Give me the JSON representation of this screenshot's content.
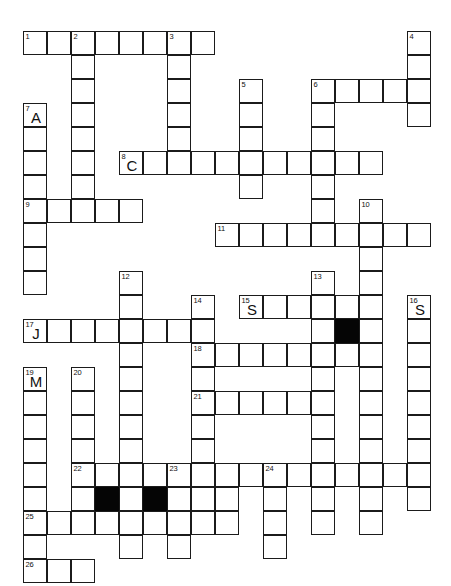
{
  "puzzle": {
    "title": "Crossword Grid",
    "grid": {
      "origin_x": 23,
      "origin_y": 31,
      "cell_size": 24,
      "columns": 17,
      "rows": 22
    },
    "colors": {
      "cell_fill": "#ffffff",
      "cell_border": "#1b1b1b",
      "block_fill": "#050505",
      "text": "#111111",
      "page_background": "#ffffff"
    },
    "legend": {
      "number_font_size_px": 7.5,
      "letter_font_size_px": 15
    },
    "cells": [
      {
        "c": 0,
        "r": 0,
        "num": "1",
        "letter": ""
      },
      {
        "c": 1,
        "r": 0,
        "num": "",
        "letter": ""
      },
      {
        "c": 2,
        "r": 0,
        "num": "2",
        "letter": ""
      },
      {
        "c": 3,
        "r": 0,
        "num": "",
        "letter": ""
      },
      {
        "c": 4,
        "r": 0,
        "num": "",
        "letter": ""
      },
      {
        "c": 5,
        "r": 0,
        "num": "",
        "letter": ""
      },
      {
        "c": 6,
        "r": 0,
        "num": "3",
        "letter": ""
      },
      {
        "c": 7,
        "r": 0,
        "num": "",
        "letter": ""
      },
      {
        "c": 16,
        "r": 0,
        "num": "4",
        "letter": ""
      },
      {
        "c": 2,
        "r": 1,
        "num": "",
        "letter": ""
      },
      {
        "c": 6,
        "r": 1,
        "num": "",
        "letter": ""
      },
      {
        "c": 16,
        "r": 1,
        "num": "",
        "letter": ""
      },
      {
        "c": 2,
        "r": 2,
        "num": "",
        "letter": ""
      },
      {
        "c": 6,
        "r": 2,
        "num": "",
        "letter": ""
      },
      {
        "c": 9,
        "r": 2,
        "num": "5",
        "letter": ""
      },
      {
        "c": 12,
        "r": 2,
        "num": "6",
        "letter": ""
      },
      {
        "c": 13,
        "r": 2,
        "num": "",
        "letter": ""
      },
      {
        "c": 14,
        "r": 2,
        "num": "",
        "letter": ""
      },
      {
        "c": 15,
        "r": 2,
        "num": "",
        "letter": ""
      },
      {
        "c": 16,
        "r": 2,
        "num": "",
        "letter": ""
      },
      {
        "c": 0,
        "r": 3,
        "num": "7",
        "letter": "A"
      },
      {
        "c": 2,
        "r": 3,
        "num": "",
        "letter": ""
      },
      {
        "c": 6,
        "r": 3,
        "num": "",
        "letter": ""
      },
      {
        "c": 9,
        "r": 3,
        "num": "",
        "letter": ""
      },
      {
        "c": 12,
        "r": 3,
        "num": "",
        "letter": ""
      },
      {
        "c": 16,
        "r": 3,
        "num": "",
        "letter": ""
      },
      {
        "c": 0,
        "r": 4,
        "num": "",
        "letter": ""
      },
      {
        "c": 2,
        "r": 4,
        "num": "",
        "letter": ""
      },
      {
        "c": 6,
        "r": 4,
        "num": "",
        "letter": ""
      },
      {
        "c": 9,
        "r": 4,
        "num": "",
        "letter": ""
      },
      {
        "c": 12,
        "r": 4,
        "num": "",
        "letter": ""
      },
      {
        "c": 0,
        "r": 5,
        "num": "",
        "letter": ""
      },
      {
        "c": 2,
        "r": 5,
        "num": "",
        "letter": ""
      },
      {
        "c": 4,
        "r": 5,
        "num": "8",
        "letter": "C"
      },
      {
        "c": 5,
        "r": 5,
        "num": "",
        "letter": ""
      },
      {
        "c": 6,
        "r": 5,
        "num": "",
        "letter": ""
      },
      {
        "c": 7,
        "r": 5,
        "num": "",
        "letter": ""
      },
      {
        "c": 8,
        "r": 5,
        "num": "",
        "letter": ""
      },
      {
        "c": 9,
        "r": 5,
        "num": "",
        "letter": ""
      },
      {
        "c": 10,
        "r": 5,
        "num": "",
        "letter": ""
      },
      {
        "c": 11,
        "r": 5,
        "num": "",
        "letter": ""
      },
      {
        "c": 12,
        "r": 5,
        "num": "",
        "letter": ""
      },
      {
        "c": 13,
        "r": 5,
        "num": "",
        "letter": ""
      },
      {
        "c": 14,
        "r": 5,
        "num": "",
        "letter": ""
      },
      {
        "c": 0,
        "r": 6,
        "num": "",
        "letter": ""
      },
      {
        "c": 2,
        "r": 6,
        "num": "",
        "letter": ""
      },
      {
        "c": 9,
        "r": 6,
        "num": "",
        "letter": ""
      },
      {
        "c": 12,
        "r": 6,
        "num": "",
        "letter": ""
      },
      {
        "c": 0,
        "r": 7,
        "num": "9",
        "letter": ""
      },
      {
        "c": 1,
        "r": 7,
        "num": "",
        "letter": ""
      },
      {
        "c": 2,
        "r": 7,
        "num": "",
        "letter": ""
      },
      {
        "c": 3,
        "r": 7,
        "num": "",
        "letter": ""
      },
      {
        "c": 4,
        "r": 7,
        "num": "",
        "letter": ""
      },
      {
        "c": 12,
        "r": 7,
        "num": "",
        "letter": ""
      },
      {
        "c": 14,
        "r": 7,
        "num": "10",
        "letter": ""
      },
      {
        "c": 0,
        "r": 8,
        "num": "",
        "letter": ""
      },
      {
        "c": 8,
        "r": 8,
        "num": "11",
        "letter": ""
      },
      {
        "c": 9,
        "r": 8,
        "num": "",
        "letter": ""
      },
      {
        "c": 10,
        "r": 8,
        "num": "",
        "letter": ""
      },
      {
        "c": 11,
        "r": 8,
        "num": "",
        "letter": ""
      },
      {
        "c": 12,
        "r": 8,
        "num": "",
        "letter": ""
      },
      {
        "c": 13,
        "r": 8,
        "num": "",
        "letter": ""
      },
      {
        "c": 14,
        "r": 8,
        "num": "",
        "letter": ""
      },
      {
        "c": 15,
        "r": 8,
        "num": "",
        "letter": ""
      },
      {
        "c": 16,
        "r": 8,
        "num": "",
        "letter": ""
      },
      {
        "c": 0,
        "r": 9,
        "num": "",
        "letter": ""
      },
      {
        "c": 14,
        "r": 9,
        "num": "",
        "letter": ""
      },
      {
        "c": 0,
        "r": 10,
        "num": "",
        "letter": ""
      },
      {
        "c": 4,
        "r": 10,
        "num": "12",
        "letter": ""
      },
      {
        "c": 12,
        "r": 10,
        "num": "13",
        "letter": ""
      },
      {
        "c": 14,
        "r": 10,
        "num": "",
        "letter": ""
      },
      {
        "c": 4,
        "r": 11,
        "num": "",
        "letter": ""
      },
      {
        "c": 7,
        "r": 11,
        "num": "14",
        "letter": ""
      },
      {
        "c": 9,
        "r": 11,
        "num": "15",
        "letter": "S"
      },
      {
        "c": 10,
        "r": 11,
        "num": "",
        "letter": ""
      },
      {
        "c": 11,
        "r": 11,
        "num": "",
        "letter": ""
      },
      {
        "c": 12,
        "r": 11,
        "num": "",
        "letter": ""
      },
      {
        "c": 13,
        "r": 11,
        "num": "",
        "letter": ""
      },
      {
        "c": 14,
        "r": 11,
        "num": "",
        "letter": ""
      },
      {
        "c": 16,
        "r": 11,
        "num": "16",
        "letter": "S"
      },
      {
        "c": 0,
        "r": 12,
        "num": "17",
        "letter": "J"
      },
      {
        "c": 1,
        "r": 12,
        "num": "",
        "letter": ""
      },
      {
        "c": 2,
        "r": 12,
        "num": "",
        "letter": ""
      },
      {
        "c": 3,
        "r": 12,
        "num": "",
        "letter": ""
      },
      {
        "c": 4,
        "r": 12,
        "num": "",
        "letter": ""
      },
      {
        "c": 5,
        "r": 12,
        "num": "",
        "letter": ""
      },
      {
        "c": 6,
        "r": 12,
        "num": "",
        "letter": ""
      },
      {
        "c": 7,
        "r": 12,
        "num": "",
        "letter": ""
      },
      {
        "c": 12,
        "r": 12,
        "num": "",
        "letter": ""
      },
      {
        "c": 13,
        "r": 12,
        "num": "",
        "letter": "",
        "block": true
      },
      {
        "c": 14,
        "r": 12,
        "num": "",
        "letter": ""
      },
      {
        "c": 16,
        "r": 12,
        "num": "",
        "letter": ""
      },
      {
        "c": 4,
        "r": 13,
        "num": "",
        "letter": ""
      },
      {
        "c": 7,
        "r": 13,
        "num": "18",
        "letter": ""
      },
      {
        "c": 8,
        "r": 13,
        "num": "",
        "letter": ""
      },
      {
        "c": 9,
        "r": 13,
        "num": "",
        "letter": ""
      },
      {
        "c": 10,
        "r": 13,
        "num": "",
        "letter": ""
      },
      {
        "c": 11,
        "r": 13,
        "num": "",
        "letter": ""
      },
      {
        "c": 12,
        "r": 13,
        "num": "",
        "letter": ""
      },
      {
        "c": 13,
        "r": 13,
        "num": "",
        "letter": ""
      },
      {
        "c": 14,
        "r": 13,
        "num": "",
        "letter": ""
      },
      {
        "c": 16,
        "r": 13,
        "num": "",
        "letter": ""
      },
      {
        "c": 0,
        "r": 14,
        "num": "19",
        "letter": "M"
      },
      {
        "c": 2,
        "r": 14,
        "num": "20",
        "letter": ""
      },
      {
        "c": 4,
        "r": 14,
        "num": "",
        "letter": ""
      },
      {
        "c": 7,
        "r": 14,
        "num": "",
        "letter": ""
      },
      {
        "c": 12,
        "r": 14,
        "num": "",
        "letter": ""
      },
      {
        "c": 14,
        "r": 14,
        "num": "",
        "letter": ""
      },
      {
        "c": 16,
        "r": 14,
        "num": "",
        "letter": ""
      },
      {
        "c": 0,
        "r": 15,
        "num": "",
        "letter": ""
      },
      {
        "c": 2,
        "r": 15,
        "num": "",
        "letter": ""
      },
      {
        "c": 4,
        "r": 15,
        "num": "",
        "letter": ""
      },
      {
        "c": 7,
        "r": 15,
        "num": "21",
        "letter": ""
      },
      {
        "c": 8,
        "r": 15,
        "num": "",
        "letter": ""
      },
      {
        "c": 9,
        "r": 15,
        "num": "",
        "letter": ""
      },
      {
        "c": 10,
        "r": 15,
        "num": "",
        "letter": ""
      },
      {
        "c": 11,
        "r": 15,
        "num": "",
        "letter": ""
      },
      {
        "c": 12,
        "r": 15,
        "num": "",
        "letter": ""
      },
      {
        "c": 14,
        "r": 15,
        "num": "",
        "letter": ""
      },
      {
        "c": 16,
        "r": 15,
        "num": "",
        "letter": ""
      },
      {
        "c": 0,
        "r": 16,
        "num": "",
        "letter": ""
      },
      {
        "c": 2,
        "r": 16,
        "num": "",
        "letter": ""
      },
      {
        "c": 4,
        "r": 16,
        "num": "",
        "letter": ""
      },
      {
        "c": 7,
        "r": 16,
        "num": "",
        "letter": ""
      },
      {
        "c": 12,
        "r": 16,
        "num": "",
        "letter": ""
      },
      {
        "c": 14,
        "r": 16,
        "num": "",
        "letter": ""
      },
      {
        "c": 16,
        "r": 16,
        "num": "",
        "letter": ""
      },
      {
        "c": 0,
        "r": 17,
        "num": "",
        "letter": ""
      },
      {
        "c": 2,
        "r": 17,
        "num": "",
        "letter": ""
      },
      {
        "c": 4,
        "r": 17,
        "num": "",
        "letter": ""
      },
      {
        "c": 7,
        "r": 17,
        "num": "",
        "letter": ""
      },
      {
        "c": 12,
        "r": 17,
        "num": "",
        "letter": ""
      },
      {
        "c": 14,
        "r": 17,
        "num": "",
        "letter": ""
      },
      {
        "c": 16,
        "r": 17,
        "num": "",
        "letter": ""
      },
      {
        "c": 0,
        "r": 18,
        "num": "",
        "letter": ""
      },
      {
        "c": 2,
        "r": 18,
        "num": "22",
        "letter": ""
      },
      {
        "c": 3,
        "r": 18,
        "num": "",
        "letter": ""
      },
      {
        "c": 4,
        "r": 18,
        "num": "",
        "letter": ""
      },
      {
        "c": 5,
        "r": 18,
        "num": "",
        "letter": ""
      },
      {
        "c": 6,
        "r": 18,
        "num": "23",
        "letter": ""
      },
      {
        "c": 7,
        "r": 18,
        "num": "",
        "letter": ""
      },
      {
        "c": 8,
        "r": 18,
        "num": "",
        "letter": ""
      },
      {
        "c": 9,
        "r": 18,
        "num": "",
        "letter": ""
      },
      {
        "c": 10,
        "r": 18,
        "num": "24",
        "letter": ""
      },
      {
        "c": 11,
        "r": 18,
        "num": "",
        "letter": ""
      },
      {
        "c": 12,
        "r": 18,
        "num": "",
        "letter": ""
      },
      {
        "c": 13,
        "r": 18,
        "num": "",
        "letter": ""
      },
      {
        "c": 14,
        "r": 18,
        "num": "",
        "letter": ""
      },
      {
        "c": 15,
        "r": 18,
        "num": "",
        "letter": ""
      },
      {
        "c": 16,
        "r": 18,
        "num": "",
        "letter": ""
      },
      {
        "c": 0,
        "r": 19,
        "num": "",
        "letter": ""
      },
      {
        "c": 2,
        "r": 19,
        "num": "",
        "letter": ""
      },
      {
        "c": 3,
        "r": 19,
        "num": "",
        "letter": "",
        "block": true
      },
      {
        "c": 4,
        "r": 19,
        "num": "",
        "letter": ""
      },
      {
        "c": 5,
        "r": 19,
        "num": "",
        "letter": "",
        "block": true
      },
      {
        "c": 6,
        "r": 19,
        "num": "",
        "letter": ""
      },
      {
        "c": 7,
        "r": 19,
        "num": "",
        "letter": ""
      },
      {
        "c": 8,
        "r": 19,
        "num": "",
        "letter": ""
      },
      {
        "c": 10,
        "r": 19,
        "num": "",
        "letter": ""
      },
      {
        "c": 12,
        "r": 19,
        "num": "",
        "letter": ""
      },
      {
        "c": 14,
        "r": 19,
        "num": "",
        "letter": ""
      },
      {
        "c": 16,
        "r": 19,
        "num": "",
        "letter": ""
      },
      {
        "c": 0,
        "r": 20,
        "num": "25",
        "letter": ""
      },
      {
        "c": 1,
        "r": 20,
        "num": "",
        "letter": ""
      },
      {
        "c": 2,
        "r": 20,
        "num": "",
        "letter": ""
      },
      {
        "c": 3,
        "r": 20,
        "num": "",
        "letter": ""
      },
      {
        "c": 4,
        "r": 20,
        "num": "",
        "letter": ""
      },
      {
        "c": 5,
        "r": 20,
        "num": "",
        "letter": ""
      },
      {
        "c": 6,
        "r": 20,
        "num": "",
        "letter": ""
      },
      {
        "c": 7,
        "r": 20,
        "num": "",
        "letter": ""
      },
      {
        "c": 8,
        "r": 20,
        "num": "",
        "letter": ""
      },
      {
        "c": 10,
        "r": 20,
        "num": "",
        "letter": ""
      },
      {
        "c": 12,
        "r": 20,
        "num": "",
        "letter": ""
      },
      {
        "c": 14,
        "r": 20,
        "num": "",
        "letter": ""
      },
      {
        "c": 0,
        "r": 21,
        "num": "",
        "letter": ""
      },
      {
        "c": 4,
        "r": 21,
        "num": "",
        "letter": ""
      },
      {
        "c": 6,
        "r": 21,
        "num": "",
        "letter": ""
      },
      {
        "c": 10,
        "r": 21,
        "num": "",
        "letter": ""
      },
      {
        "c": 0,
        "r": 22,
        "num": "26",
        "letter": ""
      },
      {
        "c": 1,
        "r": 22,
        "num": "",
        "letter": ""
      },
      {
        "c": 2,
        "r": 22,
        "num": "",
        "letter": ""
      }
    ]
  }
}
